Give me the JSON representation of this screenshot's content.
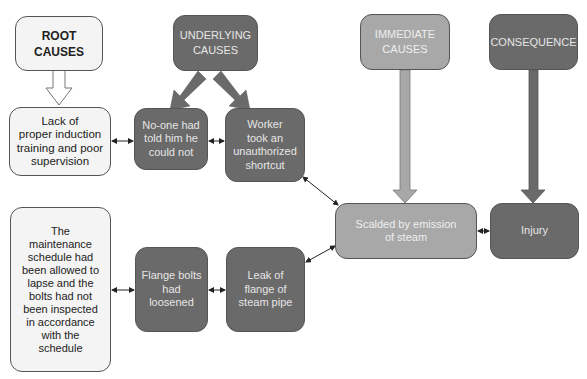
{
  "headers": {
    "root": "ROOT\nCAUSES",
    "underlying": "UNDERLYING\nCAUSES",
    "immediate": "IMMEDIATE\nCAUSES",
    "consequence": "CONSEQUENCE"
  },
  "nodes": {
    "lack_training": "Lack of\nproper induction\ntraining and poor\nsupervision",
    "no_one_told": "No-one had\ntold him he\ncould not",
    "shortcut": "Worker\ntook an\nunauthorized\nshortcut",
    "maintenance": "The\nmaintenance\nschedule had\nbeen allowed to\nlapse and the\nbolts had not\nbeen inspected\nin accordance\nwith the\nschedule",
    "flange_bolts": "Flange bolts\nhad\nloosened",
    "leak": "Leak of\nflange of\nsteam pipe",
    "scalded": "Scalded by emission\nof steam",
    "injury": "Injury"
  },
  "colors": {
    "white_box": "#f4f4f4",
    "dark_box": "#6a6a6a",
    "mid_box": "#a8a8a8"
  }
}
